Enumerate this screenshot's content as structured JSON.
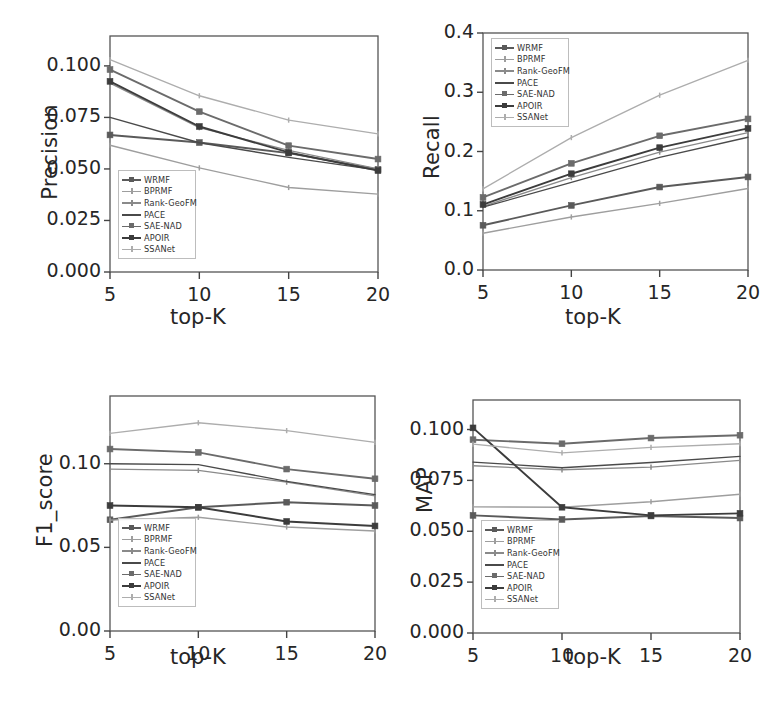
{
  "figure": {
    "background": "#ffffff",
    "panel_count": 4
  },
  "series_names": [
    "WRMF",
    "BPRMF",
    "Rank-GeoFM",
    "PACE",
    "SAE-NAD",
    "APOIR",
    "SSANet"
  ],
  "series_colors": [
    "#5a5a5a",
    "#9e9e9e",
    "#8a8a8a",
    "#4a4a4a",
    "#6b6b6b",
    "#3c3c3c",
    "#adadad"
  ],
  "series_markers": [
    "square",
    "tick",
    "tick",
    "none",
    "square",
    "square",
    "tick"
  ],
  "axis": {
    "xlabel": "top-K",
    "xticks": [
      "5",
      "10",
      "15",
      "20"
    ],
    "xvalues": [
      5,
      10,
      15,
      20
    ]
  },
  "chart_data": [
    {
      "type": "line",
      "title": "",
      "xlabel": "top-K",
      "ylabel": "Precision",
      "x": [
        5,
        10,
        15,
        20
      ],
      "xlim": [
        5,
        20
      ],
      "ylim": [
        0.0,
        0.1145
      ],
      "yticks": [
        0.0,
        0.025,
        0.05,
        0.075,
        0.1
      ],
      "ytick_labels": [
        "0.000",
        "0.025",
        "0.050",
        "0.075",
        "0.100"
      ],
      "grid": false,
      "legend_position": "lower-left",
      "series": [
        {
          "name": "WRMF",
          "values": [
            0.0665,
            0.0628,
            0.0577,
            0.0498
          ]
        },
        {
          "name": "BPRMF",
          "values": [
            0.0615,
            0.0505,
            0.041,
            0.0378
          ]
        },
        {
          "name": "Rank-GeoFM",
          "values": [
            0.0916,
            0.07,
            0.059,
            0.05
          ]
        },
        {
          "name": "PACE",
          "values": [
            0.075,
            0.0627,
            0.0556,
            0.0494
          ]
        },
        {
          "name": "SAE-NAD",
          "values": [
            0.0982,
            0.0778,
            0.0613,
            0.0548
          ]
        },
        {
          "name": "APOIR",
          "values": [
            0.0925,
            0.0706,
            0.058,
            0.0492
          ]
        },
        {
          "name": "SSANet",
          "values": [
            0.103,
            0.0855,
            0.0737,
            0.067
          ]
        }
      ]
    },
    {
      "type": "line",
      "title": "",
      "xlabel": "top-K",
      "ylabel": "Recall",
      "x": [
        5,
        10,
        15,
        20
      ],
      "xlim": [
        5,
        20
      ],
      "ylim": [
        0.0,
        0.4
      ],
      "yticks": [
        0.0,
        0.1,
        0.2,
        0.3,
        0.4
      ],
      "ytick_labels": [
        "0.0",
        "0.1",
        "0.2",
        "0.3",
        "0.4"
      ],
      "grid": false,
      "legend_position": "upper-left",
      "series": [
        {
          "name": "WRMF",
          "values": [
            0.0755,
            0.109,
            0.14,
            0.157
          ]
        },
        {
          "name": "BPRMF",
          "values": [
            0.062,
            0.0895,
            0.1125,
            0.1375
          ]
        },
        {
          "name": "Rank-GeoFM",
          "values": [
            0.1075,
            0.156,
            0.199,
            0.232
          ]
        },
        {
          "name": "PACE",
          "values": [
            0.106,
            0.148,
            0.19,
            0.224
          ]
        },
        {
          "name": "SAE-NAD",
          "values": [
            0.1225,
            0.18,
            0.2265,
            0.255
          ]
        },
        {
          "name": "APOIR",
          "values": [
            0.1105,
            0.1625,
            0.2065,
            0.239
          ]
        },
        {
          "name": "SSANet",
          "values": [
            0.137,
            0.2235,
            0.295,
            0.354
          ]
        }
      ]
    },
    {
      "type": "line",
      "title": "",
      "xlabel": "top-K",
      "ylabel": "F1_score",
      "x": [
        5,
        10,
        15,
        20
      ],
      "xlim": [
        5,
        20
      ],
      "ylim": [
        0.0,
        0.1405
      ],
      "yticks": [
        0.0,
        0.05,
        0.1
      ],
      "ytick_labels": [
        "0.00",
        "0.05",
        "0.10"
      ],
      "grid": false,
      "legend_position": "lower-left",
      "series": [
        {
          "name": "WRMF",
          "values": [
            0.0665,
            0.074,
            0.077,
            0.075
          ]
        },
        {
          "name": "BPRMF",
          "values": [
            0.0663,
            0.068,
            0.0622,
            0.0598
          ]
        },
        {
          "name": "Rank-GeoFM",
          "values": [
            0.0968,
            0.096,
            0.089,
            0.0808
          ]
        },
        {
          "name": "PACE",
          "values": [
            0.1,
            0.0995,
            0.0895,
            0.0815
          ]
        },
        {
          "name": "SAE-NAD",
          "values": [
            0.1088,
            0.1068,
            0.0968,
            0.091
          ]
        },
        {
          "name": "APOIR",
          "values": [
            0.075,
            0.074,
            0.0655,
            0.0628
          ]
        },
        {
          "name": "SSANet",
          "values": [
            0.1182,
            0.1245,
            0.1198,
            0.1128
          ]
        }
      ]
    },
    {
      "type": "line",
      "title": "",
      "xlabel": "top-K",
      "ylabel": "MAP",
      "x": [
        5,
        10,
        15,
        20
      ],
      "xlim": [
        5,
        20
      ],
      "ylim": [
        0.0,
        0.1145
      ],
      "yticks": [
        0.0,
        0.025,
        0.05,
        0.075,
        0.1
      ],
      "ytick_labels": [
        "0.000",
        "0.025",
        "0.050",
        "0.075",
        "0.100"
      ],
      "grid": false,
      "legend_position": "lower-left",
      "series": [
        {
          "name": "WRMF",
          "values": [
            0.0578,
            0.0558,
            0.0575,
            0.0565
          ]
        },
        {
          "name": "BPRMF",
          "values": [
            0.062,
            0.0618,
            0.0645,
            0.0682
          ]
        },
        {
          "name": "Rank-GeoFM",
          "values": [
            0.0822,
            0.0802,
            0.0815,
            0.0848
          ]
        },
        {
          "name": "PACE",
          "values": [
            0.084,
            0.0812,
            0.0838,
            0.0868
          ]
        },
        {
          "name": "SAE-NAD",
          "values": [
            0.095,
            0.093,
            0.0958,
            0.0972
          ]
        },
        {
          "name": "APOIR",
          "values": [
            0.1008,
            0.0618,
            0.0578,
            0.0588
          ]
        },
        {
          "name": "SSANet",
          "values": [
            0.0928,
            0.0885,
            0.0912,
            0.093
          ]
        }
      ]
    }
  ]
}
